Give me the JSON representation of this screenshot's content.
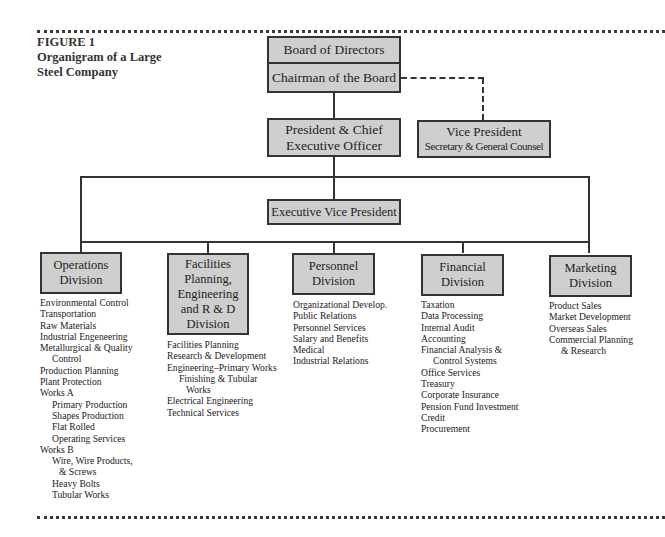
{
  "figure": {
    "label": "FIGURE 1",
    "caption_line1": "Organigram of a Large",
    "caption_line2": "Steel Company"
  },
  "nodes": {
    "board": "Board of Directors",
    "chairman": "Chairman of the Board",
    "president_line1": "President & Chief",
    "president_line2": "Executive Officer",
    "vice_president_line1": "Vice President",
    "vice_president_line2": "Secretary & General Counsel",
    "executive_vp": "Executive Vice President"
  },
  "divisions": [
    {
      "title_lines": [
        "Operations",
        "Division"
      ],
      "items": [
        {
          "text": "Environmental Control",
          "indent": 0
        },
        {
          "text": "Transportation",
          "indent": 0
        },
        {
          "text": "Raw Materials",
          "indent": 0
        },
        {
          "text": "Industrial Engeneering",
          "indent": 0
        },
        {
          "text": "Metallurgical & Quality",
          "indent": 0
        },
        {
          "text": "Control",
          "indent": 1
        },
        {
          "text": "Production Planning",
          "indent": 0
        },
        {
          "text": "Plant Protection",
          "indent": 0
        },
        {
          "text": "Works A",
          "indent": 0
        },
        {
          "text": "Primary Production",
          "indent": 1
        },
        {
          "text": "Shapes Production",
          "indent": 1
        },
        {
          "text": "Flat Rolled",
          "indent": 1
        },
        {
          "text": "Operating Services",
          "indent": 1
        },
        {
          "text": "Works B",
          "indent": 0
        },
        {
          "text": "Wire, Wire Products,",
          "indent": 1
        },
        {
          "text": "& Screws",
          "indent": 2
        },
        {
          "text": "Heavy Bolts",
          "indent": 1
        },
        {
          "text": "Tubular Works",
          "indent": 1
        }
      ]
    },
    {
      "title_lines": [
        "Facilities",
        "Planning,",
        "Engineering",
        "and R & D",
        "Division"
      ],
      "items": [
        {
          "text": "Facilities Planning",
          "indent": 0
        },
        {
          "text": "Research & Development",
          "indent": 0
        },
        {
          "text": "Engineering–Primary Works",
          "indent": 0
        },
        {
          "text": "Finishing & Tubular",
          "indent": 1
        },
        {
          "text": "Works",
          "indent": 2
        },
        {
          "text": "Electrical Engineering",
          "indent": 0
        },
        {
          "text": "Technical Services",
          "indent": 0
        }
      ]
    },
    {
      "title_lines": [
        "Personnel",
        "Division"
      ],
      "items": [
        {
          "text": "Organizational Develop.",
          "indent": 0
        },
        {
          "text": "Public Relations",
          "indent": 0
        },
        {
          "text": "Personnel Services",
          "indent": 0
        },
        {
          "text": "Salary and Benefits",
          "indent": 0
        },
        {
          "text": "Medical",
          "indent": 0
        },
        {
          "text": "Industrial Relations",
          "indent": 0
        }
      ]
    },
    {
      "title_lines": [
        "Financial",
        "Division"
      ],
      "items": [
        {
          "text": "Taxation",
          "indent": 0
        },
        {
          "text": "Data Processing",
          "indent": 0
        },
        {
          "text": "Internal Audit",
          "indent": 0
        },
        {
          "text": "Accounting",
          "indent": 0
        },
        {
          "text": "Financial Analysis &",
          "indent": 0
        },
        {
          "text": "Control Systems",
          "indent": 1
        },
        {
          "text": "Office Services",
          "indent": 0
        },
        {
          "text": "Treasury",
          "indent": 0
        },
        {
          "text": "Corporate Insurance",
          "indent": 0
        },
        {
          "text": "Pension Fund Investment",
          "indent": 0
        },
        {
          "text": "Credit",
          "indent": 0
        },
        {
          "text": "Procurement",
          "indent": 0
        }
      ]
    },
    {
      "title_lines": [
        "Marketing",
        "Division"
      ],
      "items": [
        {
          "text": "Product Sales",
          "indent": 0
        },
        {
          "text": "Market Development",
          "indent": 0
        },
        {
          "text": "Overseas Sales",
          "indent": 0
        },
        {
          "text": "Commercial Planning",
          "indent": 0
        },
        {
          "text": "& Research",
          "indent": 1
        }
      ]
    }
  ],
  "colors": {
    "box_fill": "#cfcfcf",
    "border": "#333333"
  }
}
